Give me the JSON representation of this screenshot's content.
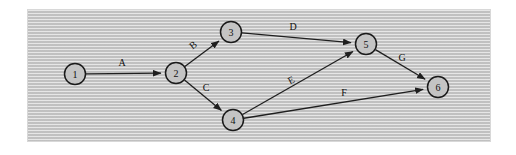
{
  "figure": {
    "kind": "activity-network-diagram",
    "background_color": "#ffffff",
    "panel_color": "#c8c8c8",
    "node_fill": "#c4c4c4",
    "node_stroke": "#1a1a1a",
    "edge_color": "#1f1f1f"
  },
  "nodes": [
    {
      "id": "1",
      "label": "1",
      "cx": 75,
      "cy": 74,
      "r": 10.5
    },
    {
      "id": "2",
      "label": "2",
      "cx": 176,
      "cy": 73,
      "r": 10.5
    },
    {
      "id": "3",
      "label": "3",
      "cx": 231,
      "cy": 32,
      "r": 10.5
    },
    {
      "id": "4",
      "label": "4",
      "cx": 233,
      "cy": 120,
      "r": 10.5
    },
    {
      "id": "5",
      "label": "5",
      "cx": 366,
      "cy": 44,
      "r": 10.5
    },
    {
      "id": "6",
      "label": "6",
      "cx": 438,
      "cy": 87,
      "r": 10.5
    }
  ],
  "edges": [
    {
      "id": "A",
      "label": "A",
      "from": "1",
      "to": "2",
      "label_x": 122,
      "label_y": 62,
      "label_rotation": 0
    },
    {
      "id": "B",
      "label": "B",
      "from": "2",
      "to": "3",
      "label_x": 193,
      "label_y": 45,
      "label_rotation": -38
    },
    {
      "id": "C",
      "label": "C",
      "from": "2",
      "to": "4",
      "label_x": 206,
      "label_y": 87,
      "label_rotation": 0
    },
    {
      "id": "D",
      "label": "D",
      "from": "3",
      "to": "5",
      "label_x": 293,
      "label_y": 26,
      "label_rotation": 0
    },
    {
      "id": "E",
      "label": "E",
      "from": "4",
      "to": "5",
      "label_x": 291,
      "label_y": 80,
      "label_rotation": -28
    },
    {
      "id": "F",
      "label": "F",
      "from": "4",
      "to": "6",
      "label_x": 344,
      "label_y": 92,
      "label_rotation": 0
    },
    {
      "id": "G",
      "label": "G",
      "from": "5",
      "to": "6",
      "label_x": 402,
      "label_y": 57,
      "label_rotation": 0
    }
  ],
  "chart_data": {
    "type": "diagram",
    "title": "",
    "nodes": [
      "1",
      "2",
      "3",
      "4",
      "5",
      "6"
    ],
    "directed_edges": [
      {
        "label": "A",
        "source": "1",
        "target": "2"
      },
      {
        "label": "B",
        "source": "2",
        "target": "3"
      },
      {
        "label": "C",
        "source": "2",
        "target": "4"
      },
      {
        "label": "D",
        "source": "3",
        "target": "5"
      },
      {
        "label": "E",
        "source": "4",
        "target": "5"
      },
      {
        "label": "F",
        "source": "4",
        "target": "6"
      },
      {
        "label": "G",
        "source": "5",
        "target": "6"
      }
    ]
  }
}
